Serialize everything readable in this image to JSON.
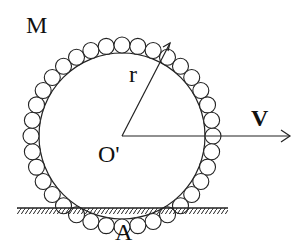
{
  "diagram": {
    "type": "physics-diagram",
    "labels": {
      "mass": "M",
      "radius": "r",
      "center": "O'",
      "velocity": "V",
      "contact_point": "A"
    },
    "bead_count": 36,
    "colors": {
      "stroke": "#222222",
      "background": "#ffffff"
    }
  }
}
